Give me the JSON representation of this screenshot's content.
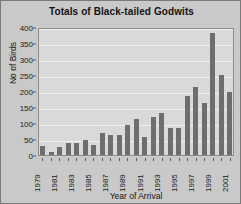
{
  "chart_data": {
    "type": "bar",
    "title": "Totals of Black-tailed Godwits",
    "xlabel": "Year of Arrival",
    "ylabel": "No of Birds",
    "categories": [
      "1979",
      "1980",
      "1981",
      "1982",
      "1983",
      "1984",
      "1985",
      "1986",
      "1987",
      "1988",
      "1989",
      "1990",
      "1991",
      "1992",
      "1993",
      "1994",
      "1995",
      "1996",
      "1997",
      "1998",
      "1999",
      "2000",
      "2001"
    ],
    "values": [
      28,
      8,
      25,
      36,
      36,
      48,
      30,
      68,
      63,
      62,
      95,
      111,
      55,
      119,
      130,
      85,
      84,
      185,
      212,
      163,
      380,
      251,
      197
    ],
    "x_tick_labels": [
      "1979",
      "",
      "1981",
      "",
      "1983",
      "",
      "1985",
      "",
      "1987",
      "",
      "1989",
      "",
      "1991",
      "",
      "1993",
      "",
      "1995",
      "",
      "1997",
      "",
      "1999",
      "",
      "2001"
    ],
    "ylim": [
      0,
      400
    ],
    "y_ticks": [
      0,
      50,
      100,
      150,
      200,
      250,
      300,
      350,
      400
    ],
    "y_tick_labels": [
      "0",
      "50",
      "100",
      "150",
      "200",
      "250",
      "300",
      "350",
      "400"
    ],
    "grid": true,
    "legend": false,
    "series_color": "#6e6e6e",
    "plot_background": "#d9d9d9",
    "figure_background": "#c9c9c9",
    "gridline_color": "#efefef"
  }
}
